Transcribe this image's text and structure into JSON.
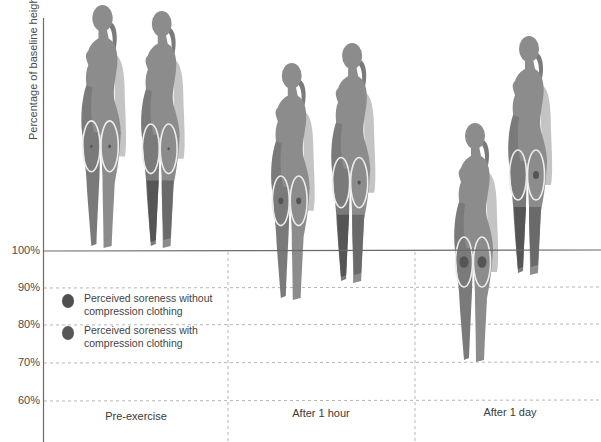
{
  "chart_data": {
    "type": "pictogram",
    "title": "",
    "ylabel": "Percentage of baseline height",
    "xlabel": "",
    "ylim": [
      60,
      100
    ],
    "yticks": [
      "100%",
      "90%",
      "80%",
      "70%",
      "60%"
    ],
    "grid": true,
    "categories": [
      "Pre-exercise",
      "After 1 hour",
      "After 1 day"
    ],
    "series": [
      {
        "name": "Perceived soreness without compression clothing",
        "soreness_level": [
          "low",
          "medium",
          "high"
        ],
        "figure_baseline_pct": [
          100,
          86,
          71
        ]
      },
      {
        "name": "Perceived soreness with compression clothing",
        "soreness_level": [
          "very low",
          "low",
          "medium"
        ],
        "figure_baseline_pct": [
          100,
          91,
          94
        ]
      }
    ],
    "legend_position": "lower-left inside plot"
  },
  "axis": {
    "ylabel": "Percentage of baseline height",
    "ticks": [
      {
        "label": "100%",
        "y": 251
      },
      {
        "label": "90%",
        "y": 288
      },
      {
        "label": "80%",
        "y": 325
      },
      {
        "label": "70%",
        "y": 363
      },
      {
        "label": "60%",
        "y": 401
      }
    ]
  },
  "categories": [
    {
      "label": "Pre-exercise",
      "x": 136,
      "y": 410
    },
    {
      "label": "After 1 hour",
      "x": 321,
      "y": 407
    },
    {
      "label": "After 1 day",
      "x": 510,
      "y": 406
    }
  ],
  "legend": {
    "items": [
      {
        "label": "Perceived soreness without compression clothing",
        "color": "#4f4f4f"
      },
      {
        "label": "Perceived soreness with compression clothing",
        "color": "#575757"
      }
    ]
  },
  "colors": {
    "body": "#8c8c8c",
    "body_shadow": "#7a7a7a",
    "arm": "#c4c4c4",
    "compression": "#555555",
    "oval_stroke": "#ececec",
    "dot": "#555555",
    "axis": "#6a6a6a",
    "grid": "#b5b5b5"
  },
  "figures": [
    {
      "id": "pre-without",
      "x": 70,
      "top": 4,
      "height": 244,
      "compression": false,
      "dotL": 1.2,
      "dotR": 1.4
    },
    {
      "id": "pre-with",
      "x": 130,
      "top": 10,
      "height": 238,
      "compression": true,
      "dotL": 0,
      "dotR": 1.2
    },
    {
      "id": "hour-without",
      "x": 260,
      "top": 62,
      "height": 238,
      "compression": false,
      "dotL": 2.6,
      "dotR": 2.6
    },
    {
      "id": "hour-with",
      "x": 320,
      "top": 42,
      "height": 241,
      "compression": true,
      "dotL": 0,
      "dotR": 1.6
    },
    {
      "id": "day-without",
      "x": 443,
      "top": 122,
      "height": 240,
      "compression": false,
      "dotL": 4.5,
      "dotR": 4.5
    },
    {
      "id": "day-with",
      "x": 497,
      "top": 35,
      "height": 240,
      "compression": true,
      "dotL": 0,
      "dotR": 3.0
    }
  ]
}
